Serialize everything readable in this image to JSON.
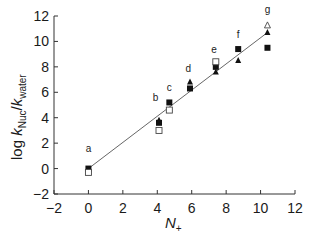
{
  "chart_data": {
    "type": "scatter",
    "title": "",
    "xlabel": "N+",
    "xlabel_main": "N",
    "xlabel_sub": "+",
    "ylabel": "log kNuc/kwater",
    "ylabel_parts": {
      "log": "log ",
      "k1": "k",
      "sub1": "Nuc",
      "slash": "/",
      "k2": "k",
      "sub2": "water"
    },
    "xlim": [
      -2,
      12
    ],
    "ylim": [
      -2,
      12
    ],
    "xticks": [
      "−2",
      "0",
      "2",
      "4",
      "6",
      "8",
      "10",
      "12"
    ],
    "yticks": [
      "−2",
      "0",
      "2",
      "4",
      "6",
      "8",
      "10",
      "12"
    ],
    "grid": false,
    "legend": null,
    "fit_line": {
      "x": [
        0,
        10.4
      ],
      "y": [
        0,
        10.7
      ]
    },
    "point_labels": [
      {
        "label": "a",
        "x": 0.0,
        "y": 1.3
      },
      {
        "label": "b",
        "x": 3.9,
        "y": 5.3
      },
      {
        "label": "c",
        "x": 4.7,
        "y": 6.1
      },
      {
        "label": "d",
        "x": 5.8,
        "y": 7.6
      },
      {
        "label": "e",
        "x": 7.3,
        "y": 9.1
      },
      {
        "label": "f",
        "x": 8.7,
        "y": 10.3
      },
      {
        "label": "g",
        "x": 10.4,
        "y": 12.2
      }
    ],
    "series": [
      {
        "name": "filled-square",
        "marker": "square-filled",
        "points": [
          [
            0.0,
            0.0
          ],
          [
            4.1,
            3.6
          ],
          [
            4.7,
            5.2
          ],
          [
            5.9,
            6.3
          ],
          [
            7.4,
            8.0
          ],
          [
            8.7,
            9.4
          ],
          [
            10.4,
            9.5
          ]
        ]
      },
      {
        "name": "filled-triangle",
        "marker": "triangle-filled",
        "points": [
          [
            4.1,
            3.8
          ],
          [
            5.9,
            6.8
          ],
          [
            7.4,
            7.6
          ],
          [
            8.7,
            8.5
          ],
          [
            10.4,
            10.7
          ]
        ]
      },
      {
        "name": "open-square",
        "marker": "square-open",
        "points": [
          [
            0.0,
            -0.3
          ],
          [
            4.1,
            3.0
          ],
          [
            4.7,
            4.6
          ],
          [
            7.4,
            8.4
          ]
        ]
      },
      {
        "name": "open-triangle",
        "marker": "triangle-open",
        "points": [
          [
            10.4,
            11.3
          ]
        ]
      }
    ]
  }
}
